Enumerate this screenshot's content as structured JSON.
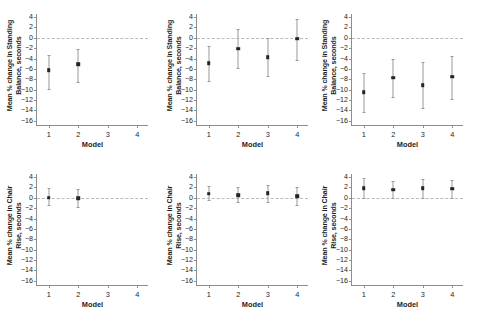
{
  "figure": {
    "xlabel": "Model",
    "ylabel_standing": "Mean % change in Standing Balance, seconds",
    "ylabel_chair": "Mean % change in Chair Rise, seconds",
    "ylabel_standing_line1": "Mean % change in Standing",
    "ylabel_standing_line2": "Balance, seconds",
    "ylabel_chair_line1": "Mean % change in Chair",
    "ylabel_chair_line2": "Rise, seconds",
    "yticks": [
      "4",
      "2",
      "0",
      "-2",
      "-4",
      "-6",
      "-8",
      "-10",
      "-12",
      "-14",
      "-16"
    ],
    "ytick_values": [
      4,
      2,
      0,
      -2,
      -4,
      -6,
      -8,
      -10,
      -12,
      -14,
      -16
    ],
    "xticks": [
      "1",
      "2",
      "3",
      "4"
    ],
    "xtick_values": [
      1,
      2,
      3,
      4
    ],
    "ylim": [
      -17,
      4.6
    ],
    "xlim": [
      0.6,
      4.4
    ],
    "colors": {
      "marker": "#242424",
      "errorbar": "#9a9a9a",
      "axis": "#8d8d8d",
      "zeroline": "#b9b9b9",
      "background": "#ffffff",
      "text": "#1d1d1d"
    }
  },
  "chart_data": [
    {
      "type": "scatter",
      "panel": "top-left",
      "title": "",
      "xlabel": "Model",
      "ylabel": "Mean % change in Standing Balance, seconds",
      "xlim": [
        0.6,
        4.4
      ],
      "ylim": [
        -17,
        4.6
      ],
      "grid": false,
      "legend": "none",
      "reference_line": 0,
      "x": [
        1,
        2
      ],
      "values": [
        -6.2,
        -5.1
      ],
      "ci_low": [
        -9.8,
        -8.6
      ],
      "ci_high": [
        -3.3,
        -2.2
      ]
    },
    {
      "type": "scatter",
      "panel": "top-middle",
      "title": "",
      "xlabel": "Model",
      "ylabel": "Mean % change in Standing Balance, seconds",
      "xlim": [
        0.6,
        4.4
      ],
      "ylim": [
        -17,
        4.6
      ],
      "grid": false,
      "legend": "none",
      "reference_line": 0,
      "x": [
        1,
        2,
        3,
        4
      ],
      "values": [
        -4.9,
        -2.1,
        -3.7,
        -0.2
      ],
      "ci_low": [
        -8.4,
        -5.9,
        -7.3,
        -4.2
      ],
      "ci_high": [
        -1.6,
        1.8,
        -0.1,
        3.7
      ]
    },
    {
      "type": "scatter",
      "panel": "top-right",
      "title": "",
      "xlabel": "Model",
      "ylabel": "Mean % change in Standing Balance, seconds",
      "xlim": [
        0.6,
        4.4
      ],
      "ylim": [
        -17,
        4.6
      ],
      "grid": false,
      "legend": "none",
      "reference_line": 0,
      "x": [
        1,
        2,
        3,
        4
      ],
      "values": [
        -10.5,
        -7.7,
        -9.1,
        -7.5
      ],
      "ci_low": [
        -14.3,
        -11.5,
        -13.5,
        -11.8
      ],
      "ci_high": [
        -6.8,
        -4.1,
        -4.7,
        -3.5
      ]
    },
    {
      "type": "scatter",
      "panel": "bottom-left",
      "title": "",
      "xlabel": "Model",
      "ylabel": "Mean % change in Chair Rise, seconds",
      "xlim": [
        0.6,
        4.4
      ],
      "ylim": [
        -17,
        4.6
      ],
      "grid": false,
      "legend": "none",
      "reference_line": 0,
      "x": [
        1,
        2
      ],
      "values": [
        0.05,
        -0.1
      ],
      "ci_low": [
        -1.4,
        -1.8
      ],
      "ci_high": [
        1.9,
        1.8
      ]
    },
    {
      "type": "scatter",
      "panel": "bottom-middle",
      "title": "",
      "xlabel": "Model",
      "ylabel": "Mean % change in Chair Rise, seconds",
      "xlim": [
        0.6,
        4.4
      ],
      "ylim": [
        -17,
        4.6
      ],
      "grid": false,
      "legend": "none",
      "reference_line": 0,
      "x": [
        1,
        2,
        3,
        4
      ],
      "values": [
        0.8,
        0.5,
        0.9,
        0.3
      ],
      "ci_low": [
        -0.5,
        -0.8,
        -0.8,
        -1.3
      ],
      "ci_high": [
        2.3,
        2.1,
        2.5,
        2.1
      ]
    },
    {
      "type": "scatter",
      "panel": "bottom-right",
      "title": "",
      "xlabel": "Model",
      "ylabel": "Mean % change in Chair Rise, seconds",
      "xlim": [
        0.6,
        4.4
      ],
      "ylim": [
        -17,
        4.6
      ],
      "grid": false,
      "legend": "none",
      "reference_line": 0,
      "x": [
        1,
        2,
        3,
        4
      ],
      "values": [
        1.9,
        1.6,
        1.9,
        1.8
      ],
      "ci_low": [
        -0.1,
        0.0,
        0.0,
        0.0
      ],
      "ci_high": [
        3.9,
        3.2,
        3.6,
        3.5
      ]
    }
  ]
}
